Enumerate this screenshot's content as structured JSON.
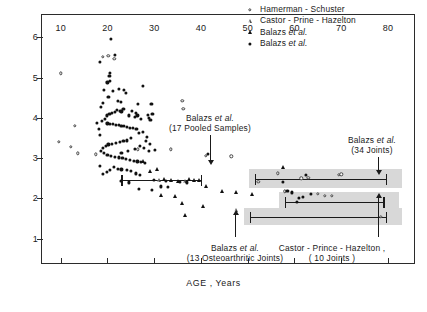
{
  "chart_data": {
    "type": "scatter",
    "title": "",
    "xlabel": "AGE , Years",
    "ylabel": "HYALURONIC  ACID,  mg/ml",
    "xlim": [
      6,
      86
    ],
    "ylim": [
      0.35,
      6.55
    ],
    "xticks": [
      10,
      20,
      30,
      40,
      50,
      60,
      70,
      80
    ],
    "xtick_labels": [
      "10",
      "20",
      "30",
      "40",
      "50",
      "60",
      "70",
      "80"
    ],
    "yticks": [
      1,
      2,
      3,
      4,
      5,
      6
    ],
    "ytick_labels": [
      "1",
      "2",
      "3",
      "4",
      "5",
      "6"
    ],
    "grid": false,
    "legend_position": "top-right",
    "series": [
      {
        "name": "Hamerman - Schuster",
        "marker": "open-circle",
        "points": [
          [
            10.0,
            5.1
          ],
          [
            9.6,
            3.4
          ],
          [
            12.2,
            3.28
          ],
          [
            13.6,
            3.12
          ],
          [
            13.0,
            3.8
          ],
          [
            17.5,
            3.1
          ],
          [
            19.0,
            5.52
          ],
          [
            21.5,
            5.47
          ],
          [
            20.2,
            5.54
          ],
          [
            26.5,
            3.22
          ],
          [
            33.5,
            3.22
          ],
          [
            36.0,
            4.42
          ],
          [
            36.2,
            4.22
          ],
          [
            41.0,
            3.06
          ],
          [
            46.5,
            3.05
          ],
          [
            52.3,
            2.42
          ],
          [
            56.5,
            2.62
          ],
          [
            58.0,
            2.18
          ],
          [
            61.5,
            2.5
          ],
          [
            63.0,
            2.52
          ],
          [
            65.0,
            2.12
          ],
          [
            66.5,
            2.07
          ],
          [
            68.0,
            2.07
          ],
          [
            69.5,
            2.58
          ],
          [
            70.0,
            2.6
          ],
          [
            78.5,
            1.55
          ]
        ]
      },
      {
        "name": "Castor - Prine - Hazelton",
        "marker": "open-triangle",
        "points": [
          [
            47.5,
            1.72
          ],
          [
            31.0,
            2.45
          ],
          [
            36.5,
            2.43
          ]
        ]
      },
      {
        "name": "Balazs et al. (triangles)",
        "marker": "filled-triangle",
        "points": [
          [
            27.5,
            2.92
          ],
          [
            29.0,
            2.68
          ],
          [
            30.5,
            2.72
          ],
          [
            32.0,
            2.48
          ],
          [
            33.5,
            2.46
          ],
          [
            35.0,
            2.44
          ],
          [
            37.5,
            2.48
          ],
          [
            38.5,
            2.47
          ],
          [
            39.5,
            2.45
          ],
          [
            31.5,
            2.08
          ],
          [
            34.5,
            2.07
          ],
          [
            36.0,
            1.88
          ],
          [
            40.5,
            1.82
          ],
          [
            44.5,
            2.18
          ],
          [
            47.5,
            2.15
          ],
          [
            51.0,
            2.12
          ],
          [
            41.0,
            2.3
          ],
          [
            57.5,
            2.78
          ],
          [
            36.5,
            1.58
          ]
        ]
      },
      {
        "name": "Balazs et al. (circles)",
        "marker": "filled-circle",
        "points": [
          [
            20.8,
            5.95
          ],
          [
            21.6,
            5.57
          ],
          [
            18.3,
            5.38
          ],
          [
            20.4,
            5.04
          ],
          [
            20.6,
            5.12
          ],
          [
            20.5,
            4.92
          ],
          [
            20.0,
            4.88
          ],
          [
            19.2,
            4.7
          ],
          [
            22.4,
            4.72
          ],
          [
            23.6,
            4.7
          ],
          [
            24.0,
            4.62
          ],
          [
            27.5,
            4.8
          ],
          [
            29.4,
            4.35
          ],
          [
            25.2,
            4.18
          ],
          [
            26.0,
            4.12
          ],
          [
            26.4,
            4.06
          ],
          [
            28.6,
            4.08
          ],
          [
            28.8,
            4.0
          ],
          [
            22.0,
            4.2
          ],
          [
            22.6,
            4.18
          ],
          [
            23.0,
            4.16
          ],
          [
            23.4,
            4.22
          ],
          [
            21.6,
            4.14
          ],
          [
            21.0,
            4.12
          ],
          [
            20.4,
            4.1
          ],
          [
            19.8,
            4.06
          ],
          [
            19.4,
            3.98
          ],
          [
            18.8,
            3.92
          ],
          [
            20.0,
            3.86
          ],
          [
            20.6,
            3.84
          ],
          [
            21.2,
            3.84
          ],
          [
            21.8,
            3.82
          ],
          [
            22.4,
            3.82
          ],
          [
            23.0,
            3.8
          ],
          [
            23.6,
            3.8
          ],
          [
            24.2,
            3.78
          ],
          [
            24.8,
            3.76
          ],
          [
            25.4,
            3.74
          ],
          [
            26.2,
            3.72
          ],
          [
            26.8,
            3.62
          ],
          [
            27.6,
            3.66
          ],
          [
            28.4,
            3.52
          ],
          [
            25.0,
            3.5
          ],
          [
            24.2,
            3.44
          ],
          [
            23.4,
            3.42
          ],
          [
            22.6,
            3.4
          ],
          [
            21.8,
            3.38
          ],
          [
            21.0,
            3.36
          ],
          [
            20.2,
            3.34
          ],
          [
            19.6,
            3.3
          ],
          [
            19.0,
            3.26
          ],
          [
            18.6,
            3.18
          ],
          [
            19.2,
            3.12
          ],
          [
            20.0,
            3.08
          ],
          [
            20.8,
            3.06
          ],
          [
            21.6,
            3.04
          ],
          [
            22.4,
            3.02
          ],
          [
            23.2,
            3.0
          ],
          [
            24.0,
            2.98
          ],
          [
            24.8,
            2.96
          ],
          [
            25.6,
            2.94
          ],
          [
            26.4,
            2.92
          ],
          [
            27.2,
            2.9
          ],
          [
            28.0,
            2.88
          ],
          [
            28.8,
            3.18
          ],
          [
            30.2,
            3.2
          ],
          [
            18.4,
            3.58
          ],
          [
            18.2,
            3.72
          ],
          [
            17.8,
            3.88
          ],
          [
            22.2,
            4.42
          ],
          [
            22.8,
            4.4
          ],
          [
            26.6,
            4.34
          ],
          [
            29.6,
            4.1
          ],
          [
            29.2,
            3.94
          ],
          [
            27.0,
            3.3
          ],
          [
            27.8,
            3.26
          ],
          [
            25.8,
            3.22
          ],
          [
            24.4,
            3.18
          ],
          [
            23.0,
            3.14
          ],
          [
            21.4,
            2.78
          ],
          [
            22.2,
            2.74
          ],
          [
            23.0,
            2.72
          ],
          [
            24.2,
            2.7
          ],
          [
            25.0,
            2.68
          ],
          [
            26.0,
            2.62
          ],
          [
            27.0,
            2.58
          ],
          [
            20.6,
            2.7
          ],
          [
            19.8,
            2.66
          ],
          [
            19.0,
            2.6
          ],
          [
            18.4,
            2.8
          ],
          [
            22.8,
            2.44
          ],
          [
            24.6,
            2.4
          ],
          [
            30.0,
            2.46
          ],
          [
            32.5,
            2.44
          ],
          [
            35.5,
            2.42
          ],
          [
            26.8,
            2.24
          ],
          [
            29.5,
            2.22
          ],
          [
            31.5,
            2.3
          ],
          [
            33.0,
            2.28
          ],
          [
            37.0,
            2.4
          ],
          [
            20.2,
            4.52
          ],
          [
            21.2,
            4.66
          ],
          [
            24.6,
            4.06
          ],
          [
            25.8,
            4.02
          ],
          [
            27.2,
            3.98
          ],
          [
            28.2,
            3.42
          ],
          [
            29.0,
            3.36
          ],
          [
            19.0,
            4.36
          ],
          [
            18.6,
            4.28
          ],
          [
            41.5,
            3.1
          ],
          [
            57.5,
            2.42
          ],
          [
            58.5,
            2.18
          ],
          [
            59.5,
            2.15
          ],
          [
            62.5,
            2.58
          ],
          [
            63.5,
            2.12
          ],
          [
            60.5,
            1.92
          ],
          [
            61.0,
            2.02
          ],
          [
            61.8,
            2.04
          ]
        ]
      }
    ],
    "range_bands": [
      {
        "label": "Balazs et al. (34 Joints)",
        "x_start": 51.5,
        "x_end": 79.5,
        "y": 2.48,
        "band_top": 2.72,
        "band_bottom": 2.25,
        "shaded": true
      },
      {
        "label": "Castor - Prince - Hazelton, (10 Joints)",
        "x_start": 58.0,
        "x_end": 79.0,
        "y": 1.92,
        "band_top": 2.16,
        "band_bottom": 1.7,
        "shaded": true
      },
      {
        "label": "Balazs et al. (13 Osteoarthritic Joints)",
        "x_start": 50.5,
        "x_end": 79.5,
        "y": 1.55,
        "band_top": 1.76,
        "band_bottom": 1.34,
        "shaded": true
      },
      {
        "label": "Balazs et al. (17 Pooled Samples)",
        "x_start": 23.0,
        "x_end": 40.0,
        "y": 2.45,
        "shaded": false
      }
    ],
    "annotations": [
      {
        "name": "balazs-17-pooled",
        "line1": "Balazs et al.",
        "line2": "(17 Pooled Samples)",
        "arrow": "down",
        "target_x": 40.0,
        "target_y": 2.45
      },
      {
        "name": "balazs-13-osteoarthritic",
        "line1": "Balazs et al.",
        "line2": "(13 Osteoarthritic Joints)",
        "arrow": "up",
        "target_x": 57.0,
        "target_y": 1.55
      },
      {
        "name": "balazs-34-joints",
        "line1": "Balazs et al.",
        "line2": "(34 Joints)",
        "arrow": "down",
        "target_x": 79.5,
        "target_y": 2.48
      },
      {
        "name": "castor-prince-hazelton-10-joints",
        "line1": "Castor - Prince - Hazelton ,",
        "line2": "( 10 Joints )",
        "arrow": "up",
        "target_x": 79.0,
        "target_y": 1.92
      }
    ]
  },
  "legend": {
    "items": [
      {
        "marker": "open-circle",
        "label_main": "Hamerman - Schuster",
        "label_italic": "",
        "label_tail": ""
      },
      {
        "marker": "open-triangle",
        "label_main": "Castor - Prine - Hazelton",
        "label_italic": "",
        "label_tail": ""
      },
      {
        "marker": "filled-triangle",
        "label_main": "Balazs ",
        "label_italic": "et al.",
        "label_tail": ""
      },
      {
        "marker": "filled-circle",
        "label_main": "Balazs ",
        "label_italic": "et al.",
        "label_tail": ""
      }
    ]
  },
  "colors": {
    "marker": "#111111",
    "band_fill": "#d8d8d8",
    "axis": "#2b2b2b",
    "background": "#ffffff"
  }
}
